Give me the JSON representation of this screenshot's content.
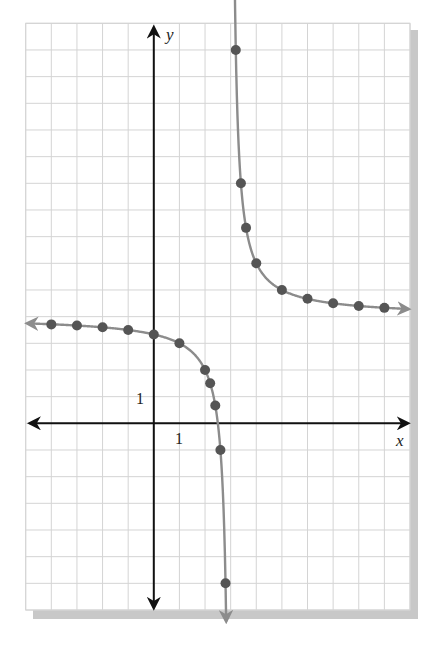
{
  "chart_data": {
    "type": "line",
    "title": "",
    "function": "y = 4 + 2/(x - 3)",
    "xlabel": "x",
    "ylabel": "y",
    "xlim": [
      -5,
      10
    ],
    "ylim": [
      -7,
      15
    ],
    "grid": true,
    "tick_labels": {
      "x": "1",
      "y": "1"
    },
    "asymptotes": {
      "vertical": 3,
      "horizontal": 4
    },
    "series": [
      {
        "name": "left-branch",
        "points": [
          [
            -4,
            3.71
          ],
          [
            -3,
            3.67
          ],
          [
            -2,
            3.6
          ],
          [
            -1,
            3.5
          ],
          [
            0,
            3.33
          ],
          [
            1,
            3.0
          ],
          [
            2,
            2.0
          ],
          [
            2.2,
            1.5
          ],
          [
            2.4,
            0.67
          ],
          [
            2.6,
            -1.0
          ],
          [
            2.8,
            -6.0
          ]
        ]
      },
      {
        "name": "right-branch",
        "points": [
          [
            3.2,
            14.0
          ],
          [
            3.4,
            9.0
          ],
          [
            3.6,
            7.33
          ],
          [
            4,
            6.0
          ],
          [
            5,
            5.0
          ],
          [
            6,
            4.67
          ],
          [
            7,
            4.5
          ],
          [
            8,
            4.4
          ],
          [
            9,
            4.33
          ]
        ]
      }
    ]
  },
  "colors": {
    "grid": "#d4d4d4",
    "axis": "#111111",
    "curve": "#8c8c8c",
    "point": "#555555",
    "shadow": "#c8c8c8"
  },
  "labels": {
    "x_axis": "x",
    "y_axis": "y",
    "x_tick": "1",
    "y_tick": "1"
  }
}
